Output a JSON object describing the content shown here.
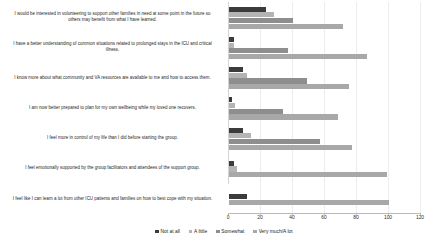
{
  "chart_data": {
    "type": "bar",
    "orientation": "horizontal",
    "title": "",
    "subtitle": "",
    "xlabel": "",
    "ylabel": "",
    "xlim": [
      0,
      120
    ],
    "xticks": [
      0,
      20,
      40,
      60,
      80,
      100,
      120
    ],
    "grid": true,
    "grid_axis": "x",
    "legend_position": "bottom",
    "legend": [
      "Not at all",
      "A little",
      "Somewhat",
      "Very much/A lot"
    ],
    "series_colors": [
      "#3b3b3b",
      "#b4b4b4",
      "#8e8e8e",
      "#a8a8a8"
    ],
    "categories": [
      "I would be interested in volunteering to support other families in need at some point in the future so others may benefit from what I have learned.",
      "I have a better understanding of common situations related to prolonged stays in the ICU and critical illness.",
      "I know more about what community and VA resources are available to me and how to access them.",
      "I am now better prepared to plan for my own wellbeing while my loved one recovers.",
      "I feel more in control of my life than I did before starting the group.",
      "I feel emotionally supported by the group facilitators and attendees of the support group.",
      "I feel like I can learn a lot from other ICU patients and families on how to best cope with my situation."
    ],
    "series": [
      {
        "name": "Not at all",
        "color": "#3b3b3b",
        "values": [
          23,
          3,
          9,
          2,
          9,
          3,
          11
        ]
      },
      {
        "name": "A little",
        "color": "#b4b4b4",
        "values": [
          28,
          3,
          11,
          4,
          14,
          5,
          0
        ]
      },
      {
        "name": "Somewhat",
        "color": "#8e8e8e",
        "values": [
          40,
          37,
          49,
          34,
          57,
          0,
          0
        ]
      },
      {
        "name": "Very much/A lot",
        "color": "#a8a8a8",
        "values": [
          71,
          86,
          75,
          68,
          77,
          99,
          100
        ]
      }
    ]
  }
}
